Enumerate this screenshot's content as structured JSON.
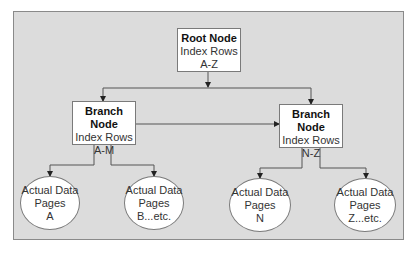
{
  "diagram": {
    "root": {
      "title": "Root Node",
      "line1": "Index Rows",
      "line2": "A-Z"
    },
    "branches": [
      {
        "title": "Branch Node",
        "line1": "Index Rows",
        "line2": "A-M"
      },
      {
        "title": "Branch Node",
        "line1": "Index Rows",
        "line2": "N-Z"
      }
    ],
    "leaves": [
      {
        "line1": "Actual Data",
        "line2": "Pages",
        "line3": "A"
      },
      {
        "line1": "Actual Data",
        "line2": "Pages",
        "line3": "B...etc."
      },
      {
        "line1": "Actual Data",
        "line2": "Pages",
        "line3": "N"
      },
      {
        "line1": "Actual Data",
        "line2": "Pages",
        "line3": "Z...etc."
      }
    ],
    "colors": {
      "background": "#dcdcdc",
      "node_fill": "#ffffff",
      "border": "#7a7a7a",
      "line": "#555555"
    }
  }
}
